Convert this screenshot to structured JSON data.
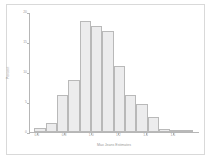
{
  "chart_data": {
    "type": "bar",
    "title": "",
    "xlabel": "Max Jeans Estimates",
    "ylabel": "Percent",
    "xlim": [
      0.55,
      1.8
    ],
    "ylim": [
      0,
      20
    ],
    "grid": false,
    "legend": null,
    "bin_width": 0.0833,
    "x_ticks": [
      0.6,
      0.8,
      1.0,
      1.2,
      1.4,
      1.6
    ],
    "x_tick_labels": [
      "0.6",
      "0.8",
      "1.0",
      "1.2",
      "1.4",
      "1.6"
    ],
    "y_ticks": [
      0,
      5,
      10,
      15,
      20
    ],
    "y_tick_labels": [
      "0",
      "5",
      "10",
      "15",
      "20"
    ],
    "categories": [
      "0.58",
      "0.67",
      "0.75",
      "0.83",
      "0.92",
      "1.00",
      "1.08",
      "1.17",
      "1.25",
      "1.33",
      "1.42",
      "1.50",
      "1.58",
      "1.67"
    ],
    "bin_edges": [
      0.583,
      0.667,
      0.75,
      0.833,
      0.917,
      1.0,
      1.083,
      1.167,
      1.25,
      1.333,
      1.417,
      1.5,
      1.583,
      1.667,
      1.75
    ],
    "values": [
      0.7,
      1.5,
      6.2,
      8.6,
      18.5,
      17.6,
      16.8,
      11.0,
      6.2,
      4.7,
      2.5,
      0.5,
      0.4,
      0.3
    ],
    "colors": {
      "bar_fill": "#ececed",
      "bar_edge": "#b9b9b9",
      "axis": "#b6b6b6",
      "text": "#9a9a9a",
      "frame": "#d9d9d9",
      "background": "#ffffff"
    }
  }
}
